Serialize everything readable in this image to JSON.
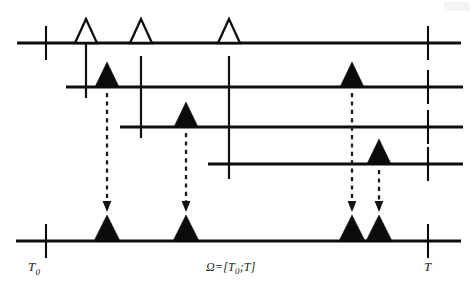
{
  "figure": {
    "kind": "point-process-superposition-diagram",
    "width": 476,
    "height": 295,
    "background_color": "#ffffff",
    "ink_color": "#0d0d0d",
    "labels": {
      "start_time": "T",
      "start_time_sub": "0",
      "interval": "Ω=[T",
      "interval_sub": "0",
      "interval_tail": ";T]",
      "end_time": "T"
    },
    "axes": [
      {
        "id": "row-1",
        "name": "top-timeline",
        "y": 43,
        "x_start": 17,
        "x_end": 461,
        "ticks": [
          46,
          428
        ],
        "tick_top": 26,
        "tick_bottom": 60,
        "spikes": [
          {
            "x": 86,
            "type": "hollow",
            "height": 24,
            "half_width": 11
          },
          {
            "x": 141,
            "type": "hollow",
            "height": 24,
            "half_width": 11
          },
          {
            "x": 229,
            "type": "hollow",
            "height": 24,
            "half_width": 11
          }
        ]
      },
      {
        "id": "row-2",
        "name": "second-timeline",
        "y": 87,
        "x_start": 66,
        "x_end": 463,
        "ticks": [
          428
        ],
        "tick_top": 70,
        "tick_bottom": 104,
        "spikes": [
          {
            "x": 107,
            "type": "filled",
            "height": 25,
            "half_width": 12
          },
          {
            "x": 352,
            "type": "filled",
            "height": 25,
            "half_width": 12
          }
        ]
      },
      {
        "id": "row-3",
        "name": "third-timeline",
        "y": 127,
        "x_start": 120,
        "x_end": 463,
        "ticks": [
          428
        ],
        "tick_top": 110,
        "tick_bottom": 144,
        "spikes": [
          {
            "x": 186,
            "type": "filled",
            "height": 25,
            "half_width": 12
          }
        ]
      },
      {
        "id": "row-4",
        "name": "fourth-timeline",
        "y": 164,
        "x_start": 208,
        "x_end": 463,
        "ticks": [
          428
        ],
        "tick_top": 147,
        "tick_bottom": 181,
        "spikes": [
          {
            "x": 379,
            "type": "filled",
            "height": 25,
            "half_width": 12
          }
        ]
      },
      {
        "id": "row-5",
        "name": "superposition-timeline",
        "y": 241,
        "x_start": 16,
        "x_end": 461,
        "ticks": [
          46,
          428
        ],
        "tick_top": 224,
        "tick_bottom": 258,
        "spikes": [
          {
            "x": 107,
            "type": "filled",
            "height": 26,
            "half_width": 13
          },
          {
            "x": 186,
            "type": "filled",
            "height": 26,
            "half_width": 13
          },
          {
            "x": 352,
            "type": "filled",
            "height": 26,
            "half_width": 13
          },
          {
            "x": 379,
            "type": "filled",
            "height": 26,
            "half_width": 13
          }
        ]
      }
    ],
    "connectors": [
      {
        "id": "connector-1",
        "x": 86,
        "y_top": 26,
        "y_bottom": 98
      },
      {
        "id": "connector-2",
        "x": 141,
        "y_top": 56,
        "y_bottom": 138
      },
      {
        "id": "connector-3",
        "x": 229,
        "y_top": 56,
        "y_bottom": 179
      }
    ],
    "arrows": [
      {
        "id": "arrow-1",
        "x": 107,
        "y_top": 93,
        "y_bottom": 212
      },
      {
        "id": "arrow-2",
        "x": 186,
        "y_top": 133,
        "y_bottom": 212
      },
      {
        "id": "arrow-3",
        "x": 352,
        "y_top": 93,
        "y_bottom": 212
      },
      {
        "id": "arrow-4",
        "x": 379,
        "y_top": 170,
        "y_bottom": 212
      }
    ]
  }
}
